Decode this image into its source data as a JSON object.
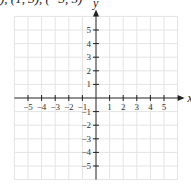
{
  "header": {
    "caption_fragment": "), (1, 3), (−3, 5)"
  },
  "chart_data": {
    "type": "scatter",
    "title": "",
    "xlabel": "x",
    "ylabel": "y",
    "xlim": [
      -6,
      6
    ],
    "ylim": [
      -6,
      6
    ],
    "grid": true,
    "x_ticks": [
      -5,
      -4,
      -3,
      -2,
      -1,
      1,
      2,
      3,
      4,
      5
    ],
    "y_ticks": [
      5,
      4,
      3,
      2,
      1,
      -1,
      -2,
      -3,
      -4,
      -5
    ],
    "x_tick_labels": [
      "−5",
      "−4",
      "−3",
      "−2",
      "−1",
      "1",
      "2",
      "3",
      "4",
      "5"
    ],
    "y_tick_labels": [
      "5",
      "4",
      "3",
      "2",
      "1",
      "−1",
      "−2",
      "−3",
      "−4",
      "−5"
    ],
    "points": [],
    "colors": {
      "grid": "#e4e4e4",
      "axis": "#222222",
      "text": "#333333"
    }
  }
}
